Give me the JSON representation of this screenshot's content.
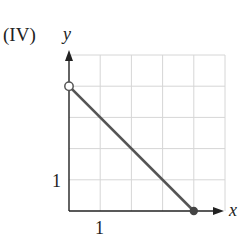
{
  "panel_label": "(IV)",
  "chart_data": {
    "type": "line",
    "title": "(IV)",
    "xlabel": "x",
    "ylabel": "y",
    "xlim": [
      0,
      5
    ],
    "ylim": [
      0,
      5
    ],
    "grid": true,
    "x_tick_labels": [
      {
        "value": 1,
        "label": "1"
      }
    ],
    "y_tick_labels": [
      {
        "value": 1,
        "label": "1"
      }
    ],
    "series": [
      {
        "name": "segment",
        "x": [
          0,
          4
        ],
        "y": [
          4,
          0
        ],
        "color": "#555555"
      }
    ],
    "endpoints": [
      {
        "x": 0,
        "y": 4,
        "style": "open"
      },
      {
        "x": 4,
        "y": 0,
        "style": "filled"
      }
    ]
  },
  "colors": {
    "grid": "#d6d6d6",
    "axis": "#222222",
    "line": "#555555",
    "point_fill": "#444444"
  }
}
